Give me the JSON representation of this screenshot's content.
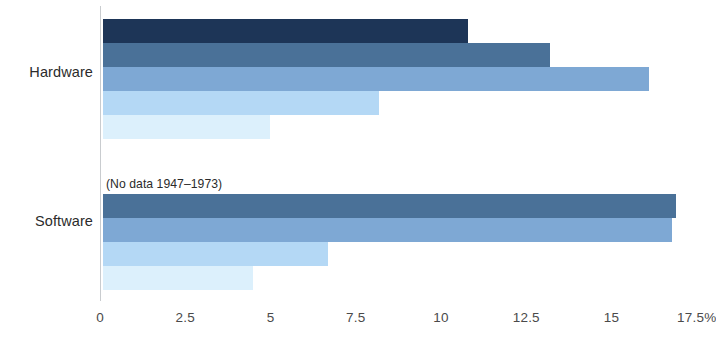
{
  "chart_data": {
    "type": "bar",
    "orientation": "horizontal",
    "title": "",
    "xlabel": "",
    "ylabel": "",
    "categories": [
      "Hardware",
      "Software"
    ],
    "xlim": [
      0,
      17.5
    ],
    "xticks": [
      0,
      2.5,
      5,
      7.5,
      10,
      12.5,
      15,
      17.5
    ],
    "xtick_labels": [
      "0",
      "2.5",
      "5",
      "7.5",
      "10",
      "12.5",
      "15",
      "17.5%"
    ],
    "grid": false,
    "legend": "none",
    "groups": [
      {
        "category": "Hardware",
        "annotation": "",
        "bars": [
          {
            "value": 10.7,
            "color": "#1d3557"
          },
          {
            "value": 13.1,
            "color": "#4a7198"
          },
          {
            "value": 16.0,
            "color": "#7ea8d4"
          },
          {
            "value": 8.1,
            "color": "#b4d8f5"
          },
          {
            "value": 4.9,
            "color": "#dcf0fc"
          }
        ]
      },
      {
        "category": "Software",
        "annotation": "(No data 1947–1973)",
        "bars": [
          {
            "value": 16.8,
            "color": "#4a7198"
          },
          {
            "value": 16.7,
            "color": "#7ea8d4"
          },
          {
            "value": 6.6,
            "color": "#b4d8f5"
          },
          {
            "value": 4.4,
            "color": "#dcf0fc"
          }
        ]
      }
    ]
  }
}
